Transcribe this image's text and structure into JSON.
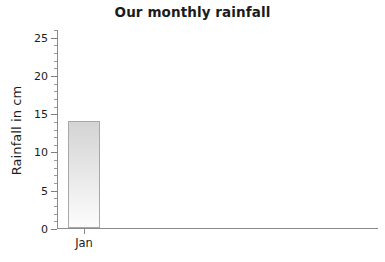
{
  "chart_data": {
    "type": "bar",
    "title": "Our monthly rainfall",
    "xlabel": "",
    "ylabel": "Rainfall in cm",
    "categories": [
      "Jan"
    ],
    "values": [
      14
    ],
    "ylim": [
      0,
      26
    ],
    "ytick_labels": [
      "0",
      "5",
      "10",
      "15",
      "20",
      "25"
    ],
    "ytick_values": [
      0,
      5,
      10,
      15,
      20,
      25
    ],
    "ytick_minor_step": 1,
    "grid": false,
    "legend": false,
    "series": [
      {
        "name": "Rainfall",
        "values": [
          14
        ]
      }
    ],
    "colors": {
      "background": "#ffffff",
      "text": "#1b1b1b",
      "axis": "#8a8a8a",
      "bar_fill_top": "#d4d4d4",
      "bar_fill_bottom": "#fcfcfc",
      "bar_border": "#a8a8a8"
    }
  }
}
